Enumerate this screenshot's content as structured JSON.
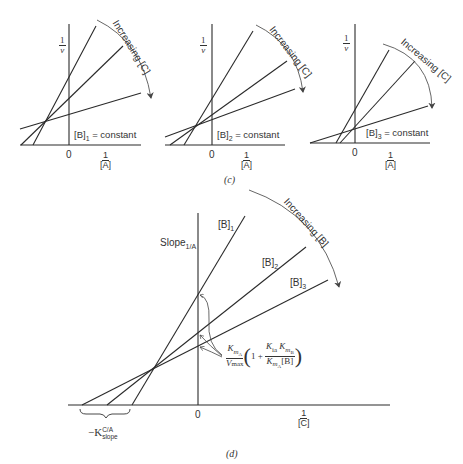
{
  "figure": {
    "panel_c": {
      "caption": "(c)",
      "plots": [
        {
          "y_label_num": "1",
          "y_label_den": "v",
          "x_label_num": "1",
          "x_label_den": "[A]",
          "origin_label": "0",
          "condition_label": "[B]",
          "condition_sub": "1",
          "condition_rest": " = constant",
          "arrow_label": "Increasing [C]"
        },
        {
          "y_label_num": "1",
          "y_label_den": "v",
          "x_label_num": "1",
          "x_label_den": "[A]",
          "origin_label": "0",
          "condition_label": "[B]",
          "condition_sub": "2",
          "condition_rest": " = constant",
          "arrow_label": "Increasing [C]"
        },
        {
          "y_label_num": "1",
          "y_label_den": "v",
          "x_label_num": "1",
          "x_label_den": "[A]",
          "origin_label": "0",
          "condition_label": "[B]",
          "condition_sub": "3",
          "condition_rest": " = constant",
          "arrow_label": "Increasing [C]"
        }
      ]
    },
    "panel_d": {
      "caption": "(d)",
      "y_label": "Slope",
      "y_label_sub": "1/A",
      "x_label_num": "1",
      "x_label_den": "[C]",
      "origin_label": "0",
      "lines": [
        {
          "label": "[B]",
          "sub": "1"
        },
        {
          "label": "[B]",
          "sub": "2"
        },
        {
          "label": "[B]",
          "sub": "3"
        }
      ],
      "arrow_label": "Increasing [B]",
      "intercept_formula": {
        "k_ma": "K",
        "k_ma_sub": "mA",
        "vmax": "V",
        "vmax_sub": "max",
        "one_plus": "1 +",
        "kia_kmb": "K",
        "kia_sub": "ia",
        "kmb": "K",
        "kmb_sub": "mB",
        "kma_b": "K",
        "kma_b_sub": "mA",
        "b_conc": "[B]"
      },
      "x_intercept_label": "−K",
      "x_intercept_sup": "C/A",
      "x_intercept_sub": "slope"
    }
  }
}
